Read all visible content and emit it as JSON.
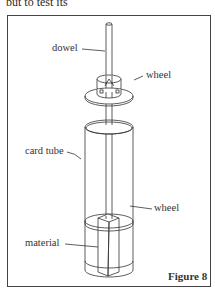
{
  "page": {
    "top_text": "but to test its"
  },
  "figure": {
    "caption": "Figure 8",
    "labels": {
      "dowel": "dowel",
      "wheel_top": "wheel",
      "card_tube": "card tube",
      "wheel_bottom": "wheel",
      "material": "material"
    }
  }
}
